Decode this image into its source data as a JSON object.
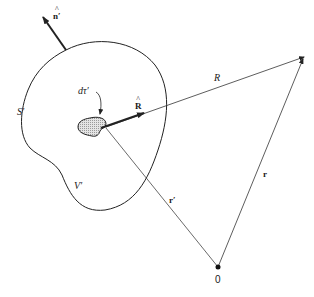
{
  "diagram": {
    "labels": {
      "normal": "n′",
      "volume_element": "dτ′",
      "unit_separation": "R",
      "separation": "R",
      "surface": "S′",
      "volume": "V′",
      "source_position": "r′",
      "field_position": "r",
      "origin": "0"
    },
    "colors": {
      "line": "#222222",
      "blob_fill": "#d8d8d8",
      "background": "#ffffff"
    },
    "elements": [
      {
        "id": "surface-S",
        "type": "closed-curve",
        "label": "S′"
      },
      {
        "id": "volume-V",
        "type": "region",
        "label": "V′"
      },
      {
        "id": "normal-n",
        "type": "unit-vector",
        "label": "n′"
      },
      {
        "id": "d-tau",
        "type": "volume-element",
        "label": "dτ′"
      },
      {
        "id": "R-hat",
        "type": "unit-vector",
        "label": "R̂"
      },
      {
        "id": "R",
        "type": "vector",
        "label": "R"
      },
      {
        "id": "r-prime",
        "type": "vector",
        "label": "r′"
      },
      {
        "id": "r",
        "type": "vector",
        "label": "r"
      },
      {
        "id": "origin",
        "type": "point",
        "label": "0"
      }
    ]
  }
}
